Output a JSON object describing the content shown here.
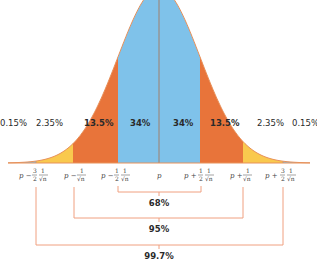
{
  "chart_data": {
    "type": "area",
    "title": "",
    "xlabel": "",
    "ylabel": "",
    "grid": false,
    "bands": [
      {
        "label": "0.15%",
        "value": 0.15,
        "from": "-inf",
        "to": "p − 3/2 · 1/√n",
        "color": "#7fc2ea"
      },
      {
        "label": "2.35%",
        "value": 2.35,
        "from": "p − 3/2 · 1/√n",
        "to": "p − 1/√n",
        "color": "#f9c94e"
      },
      {
        "label": "13.5%",
        "value": 13.5,
        "from": "p − 1/√n",
        "to": "p − 1/2 · 1/√n",
        "color": "#e8743a"
      },
      {
        "label": "34%",
        "value": 34,
        "from": "p − 1/2 · 1/√n",
        "to": "p",
        "color": "#7fc2ea"
      },
      {
        "label": "34%",
        "value": 34,
        "from": "p",
        "to": "p + 1/2 · 1/√n",
        "color": "#7fc2ea"
      },
      {
        "label": "13.5%",
        "value": 13.5,
        "from": "p + 1/2 · 1/√n",
        "to": "p + 1/√n",
        "color": "#e8743a"
      },
      {
        "label": "2.35%",
        "value": 2.35,
        "from": "p + 1/√n",
        "to": "p + 3/2 · 1/√n",
        "color": "#f9c94e"
      },
      {
        "label": "0.15%",
        "value": 0.15,
        "from": "p + 3/2 · 1/√n",
        "to": "+inf",
        "color": "#7fc2ea"
      }
    ],
    "tick_labels": [
      "p − 3/2 · 1/√n",
      "p − 1/√n",
      "p − 1/2 · 1/√n",
      "p",
      "p + 1/2 · 1/√n",
      "p + 1/√n",
      "p + 3/2 · 1/√n"
    ],
    "brackets": [
      {
        "label": "68%",
        "value": 68,
        "from": "p − 1/2 · 1/√n",
        "to": "p + 1/2 · 1/√n"
      },
      {
        "label": "95%",
        "value": 95,
        "from": "p − 1/√n",
        "to": "p + 1/√n"
      },
      {
        "label": "99.7%",
        "value": 99.7,
        "from": "p − 3/2 · 1/√n",
        "to": "p + 3/2 · 1/√n"
      }
    ],
    "colors": {
      "blue": "#7fc2ea",
      "yellow": "#f9c94e",
      "orange": "#e8743a",
      "curve": "#e8915a",
      "bracket": "#f0a080",
      "divider": "#9a8a80"
    }
  },
  "labels": {
    "tail_left": "0.15%",
    "yellow_left": "2.35%",
    "orange_left": "13.5%",
    "blue_left": "34%",
    "blue_right": "34%",
    "orange_right": "13.5%",
    "yellow_right": "2.35%",
    "tail_right": "0.15%",
    "bracket_68": "68%",
    "bracket_95": "95%",
    "bracket_997": "99.7%"
  },
  "ticks": {
    "p": "p",
    "minus": "p −",
    "plus": "p +",
    "three": "3",
    "one": "1",
    "two": "2",
    "sqrtn": "√n"
  }
}
